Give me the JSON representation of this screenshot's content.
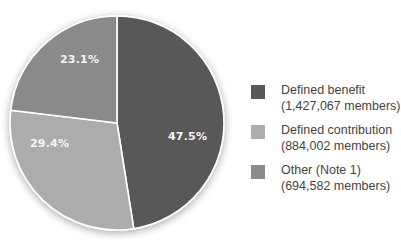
{
  "chart_data": {
    "type": "pie",
    "title": "",
    "start_angle": "12 o'clock, clockwise",
    "categories": [
      "Defined benefit",
      "Defined contribution",
      "Other (Note 1)"
    ],
    "values": [
      47.5,
      29.4,
      23.1
    ],
    "members": [
      "1,427,067",
      "884,002",
      "694,582"
    ],
    "colors": [
      "#585858",
      "#acacac",
      "#8a8a8a"
    ],
    "slice_labels": [
      "47.5%",
      "29.4%",
      "23.1%"
    ],
    "legend": [
      {
        "label": "Defined benefit",
        "sub": "(1,427,067 members)",
        "color": "#585858"
      },
      {
        "label": "Defined contribution",
        "sub": "(884,002 members)",
        "color": "#acacac"
      },
      {
        "label": "Other (Note 1)",
        "sub": "(694,582 members)",
        "color": "#8a8a8a"
      }
    ],
    "legend_position": "right"
  }
}
